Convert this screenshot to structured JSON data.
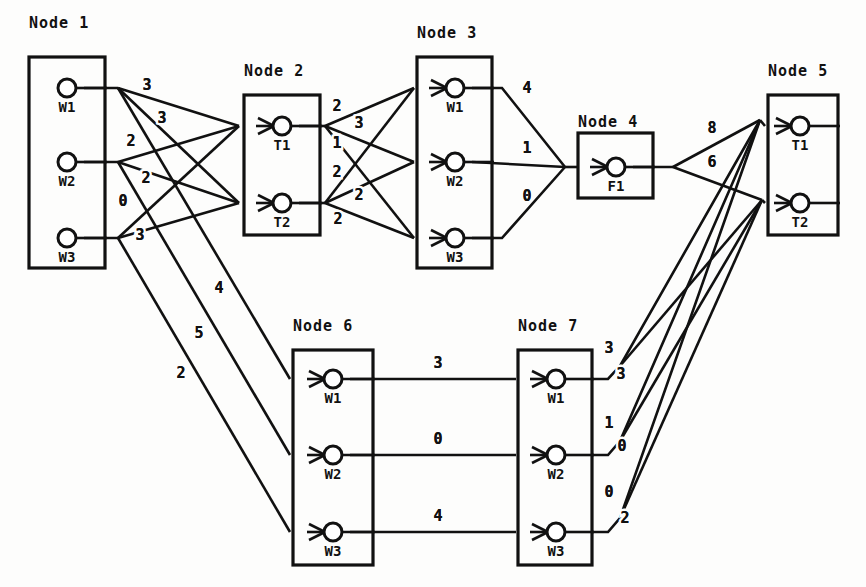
{
  "diagram": {
    "nodes": [
      {
        "id": "node1",
        "title": "Node 1",
        "title_x": 29,
        "title_y": 28,
        "box": {
          "x": 29,
          "y": 57,
          "w": 76,
          "h": 211
        },
        "has_input_arrows": false,
        "ports": [
          {
            "name": "W1",
            "cx": 67,
            "cy": 88
          },
          {
            "name": "W2",
            "cx": 67,
            "cy": 162
          },
          {
            "name": "W3",
            "cx": 67,
            "cy": 238
          }
        ]
      },
      {
        "id": "node2",
        "title": "Node 2",
        "title_x": 244,
        "title_y": 76,
        "box": {
          "x": 244,
          "y": 95,
          "w": 76,
          "h": 140
        },
        "has_input_arrows": true,
        "ports": [
          {
            "name": "T1",
            "cx": 282,
            "cy": 126
          },
          {
            "name": "T2",
            "cx": 282,
            "cy": 203
          }
        ]
      },
      {
        "id": "node3",
        "title": "Node 3",
        "title_x": 417,
        "title_y": 38,
        "box": {
          "x": 417,
          "y": 57,
          "w": 75,
          "h": 211
        },
        "has_input_arrows": true,
        "ports": [
          {
            "name": "W1",
            "cx": 455,
            "cy": 88
          },
          {
            "name": "W2",
            "cx": 455,
            "cy": 162
          },
          {
            "name": "W3",
            "cx": 455,
            "cy": 238
          }
        ]
      },
      {
        "id": "node4",
        "title": "Node 4",
        "title_x": 578,
        "title_y": 127,
        "box": {
          "x": 578,
          "y": 133,
          "w": 75,
          "h": 65
        },
        "has_input_arrows": true,
        "ports": [
          {
            "name": "F1",
            "cx": 616,
            "cy": 167
          }
        ]
      },
      {
        "id": "node5",
        "title": "Node 5",
        "title_x": 768,
        "title_y": 76,
        "box": {
          "x": 768,
          "y": 95,
          "w": 70,
          "h": 140
        },
        "has_input_arrows": true,
        "ports": [
          {
            "name": "T1",
            "cx": 800,
            "cy": 126
          },
          {
            "name": "T2",
            "cx": 800,
            "cy": 203
          }
        ]
      },
      {
        "id": "node6",
        "title": "Node 6",
        "title_x": 293,
        "title_y": 331,
        "box": {
          "x": 293,
          "y": 350,
          "w": 80,
          "h": 215
        },
        "has_input_arrows": true,
        "ports": [
          {
            "name": "W1",
            "cx": 333,
            "cy": 379
          },
          {
            "name": "W2",
            "cx": 333,
            "cy": 455
          },
          {
            "name": "W3",
            "cx": 333,
            "cy": 532
          }
        ]
      },
      {
        "id": "node7",
        "title": "Node 7",
        "title_x": 518,
        "title_y": 331,
        "box": {
          "x": 518,
          "y": 350,
          "w": 74,
          "h": 215
        },
        "has_input_arrows": true,
        "ports": [
          {
            "name": "W1",
            "cx": 556,
            "cy": 379
          },
          {
            "name": "W2",
            "cx": 556,
            "cy": 455
          },
          {
            "name": "W3",
            "cx": 556,
            "cy": 532
          }
        ]
      }
    ],
    "edge_weights": [
      {
        "id": "w-n1w1-a",
        "value": "3",
        "x": 147,
        "y": 90
      },
      {
        "id": "w-n1w1-b",
        "value": "3",
        "x": 162,
        "y": 123
      },
      {
        "id": "w-n1w2-a",
        "value": "2",
        "x": 131,
        "y": 146
      },
      {
        "id": "w-n1w2-b",
        "value": "2",
        "x": 146,
        "y": 183
      },
      {
        "id": "w-n1w3-a",
        "value": "0",
        "x": 123,
        "y": 206
      },
      {
        "id": "w-n1w3-b",
        "value": "3",
        "x": 140,
        "y": 240
      },
      {
        "id": "w-n1-n6-a",
        "value": "4",
        "x": 219,
        "y": 293
      },
      {
        "id": "w-n1-n6-b",
        "value": "5",
        "x": 199,
        "y": 338
      },
      {
        "id": "w-n1-n6-c",
        "value": "2",
        "x": 181,
        "y": 378
      },
      {
        "id": "w-n2t1-a",
        "value": "2",
        "x": 337,
        "y": 111
      },
      {
        "id": "w-n2t1-b",
        "value": "3",
        "x": 359,
        "y": 128
      },
      {
        "id": "w-n2t1-c",
        "value": "1",
        "x": 337,
        "y": 148
      },
      {
        "id": "w-n2t2-a",
        "value": "2",
        "x": 337,
        "y": 177
      },
      {
        "id": "w-n2t2-b",
        "value": "2",
        "x": 359,
        "y": 200
      },
      {
        "id": "w-n2t2-c",
        "value": "2",
        "x": 338,
        "y": 224
      },
      {
        "id": "w-n3w1",
        "value": "4",
        "x": 527,
        "y": 93
      },
      {
        "id": "w-n3w2",
        "value": "1",
        "x": 527,
        "y": 153
      },
      {
        "id": "w-n3w3",
        "value": "0",
        "x": 527,
        "y": 201
      },
      {
        "id": "w-n4-a",
        "value": "8",
        "x": 712,
        "y": 133
      },
      {
        "id": "w-n4-b",
        "value": "6",
        "x": 712,
        "y": 167
      },
      {
        "id": "w-n6w1",
        "value": "3",
        "x": 438,
        "y": 368
      },
      {
        "id": "w-n6w2",
        "value": "0",
        "x": 438,
        "y": 444
      },
      {
        "id": "w-n6w3",
        "value": "4",
        "x": 438,
        "y": 521
      },
      {
        "id": "w-n7w1-a",
        "value": "3",
        "x": 609,
        "y": 353
      },
      {
        "id": "w-n7w1-b",
        "value": "3",
        "x": 621,
        "y": 379
      },
      {
        "id": "w-n7w2-a",
        "value": "1",
        "x": 609,
        "y": 428
      },
      {
        "id": "w-n7w2-b",
        "value": "0",
        "x": 622,
        "y": 451
      },
      {
        "id": "w-n7w3-a",
        "value": "0",
        "x": 609,
        "y": 497
      },
      {
        "id": "w-n7w3-b",
        "value": "2",
        "x": 625,
        "y": 523
      }
    ],
    "colors": {
      "ink": "#111111",
      "paper": "#fdfdfc"
    }
  }
}
